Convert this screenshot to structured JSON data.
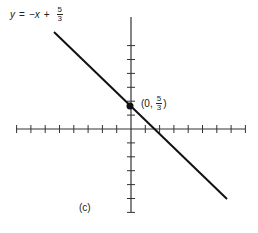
{
  "figure": {
    "caption": "(c)",
    "equation": {
      "lhs": "y",
      "equals": "=",
      "term": "−x",
      "plus": "+",
      "frac_num": "5",
      "frac_den": "3"
    },
    "point_label": {
      "open": "(0,",
      "frac_num": "5",
      "frac_den": "3",
      "close": ")"
    },
    "colors": {
      "ink": "#222222",
      "background": "#ffffff"
    }
  },
  "chart_data": {
    "type": "line",
    "title": "",
    "xlabel": "",
    "ylabel": "",
    "equation": "y = -x + 5/3",
    "series": [
      {
        "name": "y = -x + 5/3",
        "x": [
          -3.6,
          4.8
        ],
        "y": [
          5.1,
          -3.1
        ]
      }
    ],
    "points": [
      {
        "x": 0,
        "y": 1.667,
        "label": "(0, 5/3)"
      }
    ],
    "x_ticks_left": 8,
    "x_ticks_right": 8,
    "y_ticks_up": 6,
    "y_ticks_down": 6,
    "xlim": [
      -8,
      8
    ],
    "ylim": [
      -6,
      6
    ],
    "grid": false,
    "legend": "none"
  }
}
